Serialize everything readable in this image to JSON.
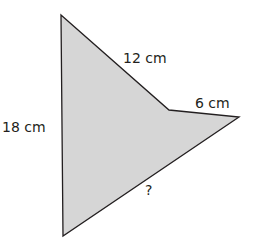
{
  "diagram": {
    "type": "polygon",
    "fill_color": "#d6d6d6",
    "stroke_color": "#231f20",
    "vertices": [
      {
        "name": "top",
        "x": 61,
        "y": 15
      },
      {
        "name": "inner",
        "x": 169,
        "y": 110
      },
      {
        "name": "right-tip",
        "x": 239,
        "y": 117
      },
      {
        "name": "bottom",
        "x": 63,
        "y": 236
      }
    ],
    "points": "61,15 169,110 239,117 63,236",
    "labels": {
      "left_side": "18 cm",
      "upper_side": "12 cm",
      "short_side": "6 cm",
      "unknown_side": "?"
    }
  }
}
